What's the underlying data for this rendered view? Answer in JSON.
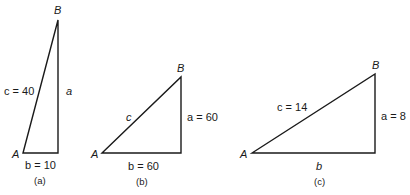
{
  "figures": [
    {
      "caption": "(a)",
      "vertices": {
        "A": "A",
        "B": "B"
      },
      "side_labels": {
        "c": "c = 40",
        "a": "a",
        "b": "b = 10"
      }
    },
    {
      "caption": "(b)",
      "vertices": {
        "A": "A",
        "B": "B"
      },
      "side_labels": {
        "c": "c",
        "a": "a = 60",
        "b": "b = 60"
      }
    },
    {
      "caption": "(c)",
      "vertices": {
        "A": "A",
        "B": "B"
      },
      "side_labels": {
        "c": "c = 14",
        "a": "a = 8",
        "b": "b"
      }
    }
  ]
}
